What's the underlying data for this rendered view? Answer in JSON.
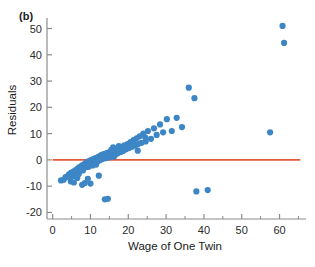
{
  "figure": {
    "panel_label": "(b)",
    "background_color": "#ffffff"
  },
  "chart_data": {
    "type": "scatter",
    "title": "",
    "subtitle": "",
    "panel": "(b)",
    "xlabel": "Wage of One Twin",
    "ylabel": "Residuals",
    "xlim": [
      -1.5,
      67
    ],
    "ylim": [
      -22.5,
      54
    ],
    "xticks": [
      0,
      10,
      20,
      30,
      40,
      50,
      60
    ],
    "xticklabels": [
      "0",
      "10",
      "20",
      "30",
      "40",
      "50",
      "60"
    ],
    "xminorticks": [
      5,
      15,
      25,
      35,
      45,
      55,
      65
    ],
    "yticks": [
      -20,
      -10,
      0,
      10,
      20,
      30,
      40,
      50
    ],
    "yticklabels": [
      "-20",
      "-10",
      "0",
      "10",
      "20",
      "30",
      "40",
      "50"
    ],
    "grid": false,
    "legend": null,
    "marker_color": "#3d86c6",
    "marker_size": 3.1,
    "axis_color": "#8c8c8c",
    "reference_line": {
      "name": "zero-residual-line",
      "orientation": "horizontal",
      "y": 0,
      "color": "#e4593a",
      "width": 1.9,
      "x_start": 0,
      "x_end": 65.5
    },
    "x": [
      2.2,
      2.9,
      3.4,
      4.0,
      4.3,
      4.6,
      4.9,
      5.2,
      5.4,
      5.6,
      5.8,
      6.0,
      6.2,
      6.4,
      6.6,
      6.8,
      6.9,
      7.0,
      7.2,
      7.3,
      7.5,
      7.6,
      7.8,
      7.9,
      8.0,
      8.1,
      8.3,
      8.4,
      8.5,
      8.6,
      8.8,
      8.9,
      9.0,
      9.1,
      9.2,
      9.4,
      9.5,
      9.6,
      9.7,
      9.8,
      9.9,
      10.0,
      10.1,
      10.2,
      10.3,
      10.4,
      10.5,
      10.6,
      10.7,
      10.8,
      10.9,
      11.0,
      11.1,
      11.2,
      11.3,
      11.4,
      11.5,
      11.6,
      11.7,
      11.8,
      11.9,
      12.0,
      12.1,
      12.2,
      12.3,
      12.4,
      12.5,
      12.6,
      12.7,
      12.8,
      12.9,
      13.0,
      13.1,
      13.2,
      13.4,
      13.5,
      13.6,
      13.8,
      14.0,
      14.2,
      14.4,
      14.6,
      14.8,
      15.0,
      15.2,
      15.4,
      15.6,
      15.8,
      16.0,
      16.2,
      16.5,
      16.8,
      17.0,
      17.3,
      17.6,
      18.0,
      18.3,
      18.6,
      19.0,
      19.4,
      19.8,
      20.2,
      20.6,
      21.0,
      21.4,
      21.8,
      22.2,
      22.6,
      23.0,
      23.5,
      24.0,
      24.6,
      25.2,
      26.0,
      26.8,
      27.5,
      28.4,
      29.2,
      30.2,
      31.5,
      32.8,
      34.2,
      36.0,
      37.5,
      38.0,
      41.0,
      57.5,
      60.8,
      61.2,
      7.8,
      13.8,
      10.0,
      14.6,
      4.8,
      5.6,
      22.5,
      19.0,
      9.3,
      12.2,
      16.0,
      11.5,
      8.5,
      6.5,
      10.6,
      13.0,
      15.5,
      17.5,
      20.5,
      24.5
    ],
    "y": [
      -7.8,
      -7.6,
      -6.6,
      -6.3,
      -5.5,
      -6.8,
      -4.8,
      -5.2,
      -6.1,
      -4.4,
      -5.8,
      -4.0,
      -5.0,
      -3.6,
      -4.6,
      -3.2,
      -5.4,
      -2.8,
      -4.2,
      -3.0,
      -3.8,
      -2.4,
      -3.4,
      -2.0,
      -4.0,
      -2.6,
      -3.1,
      -1.7,
      -2.9,
      -1.4,
      -2.5,
      -1.1,
      -2.2,
      -0.8,
      -1.9,
      -2.7,
      -0.6,
      -1.6,
      -2.3,
      -0.4,
      -1.3,
      -1.9,
      -0.2,
      -1.0,
      -1.6,
      0.0,
      -0.8,
      -1.3,
      0.2,
      -0.6,
      -1.1,
      0.4,
      -0.4,
      -0.9,
      0.6,
      -0.2,
      -0.7,
      0.8,
      0.0,
      -0.5,
      1.0,
      0.2,
      -0.3,
      1.2,
      0.4,
      -0.1,
      1.4,
      0.6,
      0.1,
      1.6,
      0.8,
      0.3,
      1.8,
      1.0,
      2.0,
      0.5,
      2.2,
      1.2,
      2.4,
      0.7,
      2.6,
      1.4,
      2.8,
      1.0,
      3.0,
      1.6,
      3.2,
      2.0,
      3.4,
      1.2,
      3.6,
      2.2,
      4.0,
      2.6,
      4.4,
      3.0,
      5.0,
      3.4,
      5.5,
      4.0,
      6.0,
      4.5,
      6.8,
      5.0,
      7.5,
      5.5,
      8.2,
      6.0,
      9.0,
      6.5,
      10.0,
      7.0,
      11.0,
      8.0,
      12.0,
      9.5,
      13.5,
      10.5,
      15.5,
      11.0,
      16.0,
      12.5,
      27.5,
      23.5,
      -12.0,
      -11.5,
      10.5,
      51.0,
      44.5,
      -9.5,
      -15.0,
      -9.0,
      -14.8,
      -8.2,
      -8.6,
      3.5,
      4.5,
      -7.2,
      -6.0,
      4.8,
      -1.8,
      -8.8,
      -6.9,
      -2.1,
      1.9,
      3.8,
      5.2,
      6.2,
      8.5
    ]
  }
}
